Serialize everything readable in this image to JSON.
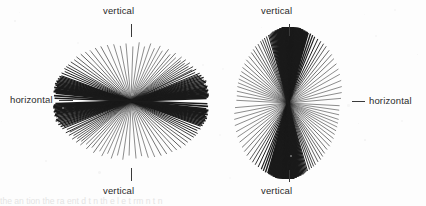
{
  "figure": {
    "background_color": "#fdfdfd",
    "ink_color": "#1a1a1a",
    "width": 426,
    "height": 206,
    "caption_partial": "the  an   tion    the ra ent  d  t  n  th   e   l   e  t rm n t  n"
  },
  "labels": {
    "vertical": "vertical",
    "horizontal": "horizontal"
  },
  "chart_data": {
    "type": "rose",
    "title": "",
    "subtitle": "",
    "xlabel": "",
    "ylabel": "",
    "grid": false,
    "legend_position": "none",
    "angle_units": "degrees",
    "angle_reference": "0 = horizontal, 90 = vertical",
    "panels": [
      {
        "id": "left",
        "name": "horizontal-preferred-orientation",
        "center": [
          131,
          101
        ],
        "radius": 78,
        "dominant_orientation": "horizontal",
        "labels": {
          "top": "vertical",
          "bottom": "vertical",
          "left": "horizontal"
        },
        "tick_marks": [
          "top-vertical",
          "bottom-vertical",
          "left-horizontal"
        ],
        "n_rays": 76,
        "angles_deg": [
          2,
          3,
          4,
          5,
          6,
          7,
          8,
          9,
          10,
          11,
          12,
          13,
          14,
          15,
          16,
          17,
          18,
          19,
          20,
          21,
          22,
          24,
          26,
          27,
          29,
          31,
          33,
          35,
          37,
          39,
          41,
          44,
          47,
          50,
          54,
          58,
          62,
          66,
          71,
          76,
          82,
          88,
          95,
          101,
          107,
          113,
          119,
          124,
          129,
          133,
          137,
          141,
          144,
          147,
          150,
          152,
          154,
          156,
          158,
          160,
          161,
          162,
          163,
          164,
          165,
          166,
          167,
          168,
          169,
          170,
          171,
          172,
          173,
          174,
          176,
          178
        ],
        "lengths_rel": [
          0.97,
          0.99,
          1.0,
          1.0,
          0.98,
          0.99,
          1.0,
          0.97,
          0.99,
          1.0,
          0.98,
          0.96,
          0.99,
          1.0,
          0.97,
          0.95,
          0.98,
          0.94,
          0.96,
          0.92,
          0.95,
          0.9,
          0.93,
          0.88,
          0.91,
          0.86,
          0.9,
          0.84,
          0.88,
          0.82,
          0.86,
          0.8,
          0.84,
          0.78,
          0.82,
          0.76,
          0.8,
          0.74,
          0.78,
          0.72,
          0.76,
          0.7,
          0.74,
          0.72,
          0.76,
          0.78,
          0.8,
          0.82,
          0.84,
          0.86,
          0.88,
          0.9,
          0.9,
          0.92,
          0.93,
          0.94,
          0.95,
          0.93,
          0.96,
          0.95,
          0.97,
          0.96,
          0.98,
          0.97,
          0.99,
          0.98,
          1.0,
          0.99,
          0.97,
          1.0,
          0.98,
          0.99,
          1.0,
          0.97,
          0.99,
          0.98
        ],
        "weights": [
          1.6,
          1.8,
          1.7,
          1.9,
          1.6,
          1.8,
          1.7,
          1.5,
          1.6,
          1.4,
          1.5,
          1.3,
          1.4,
          1.2,
          1.3,
          1.1,
          1.2,
          1.0,
          1.1,
          0.9,
          1.0,
          0.9,
          0.9,
          0.8,
          0.8,
          0.8,
          0.7,
          0.7,
          0.7,
          0.7,
          0.6,
          0.6,
          0.6,
          0.6,
          0.6,
          0.5,
          0.5,
          0.5,
          0.5,
          0.5,
          0.5,
          0.5,
          0.5,
          0.5,
          0.5,
          0.5,
          0.6,
          0.6,
          0.6,
          0.6,
          0.7,
          0.7,
          0.7,
          0.8,
          0.8,
          0.9,
          0.9,
          1.0,
          1.0,
          1.1,
          1.2,
          1.2,
          1.3,
          1.4,
          1.4,
          1.5,
          1.6,
          1.6,
          1.7,
          1.8,
          1.7,
          1.9,
          1.8,
          1.7,
          1.6,
          1.5
        ],
        "peak_angle_deg": 0,
        "concentration": "strong, girdle about the horizontal"
      },
      {
        "id": "right",
        "name": "vertical-preferred-orientation",
        "center": [
          288,
          103
        ],
        "radius": 76,
        "dominant_orientation": "vertical",
        "labels": {
          "top": "vertical",
          "bottom": "vertical",
          "right": "horizontal"
        },
        "tick_marks": [
          "top-vertical",
          "bottom-vertical",
          "right-horizontal"
        ],
        "n_rays": 78,
        "angles_deg": [
          5,
          11,
          17,
          23,
          29,
          34,
          39,
          44,
          48,
          52,
          56,
          59,
          62,
          65,
          68,
          70,
          72,
          74,
          75,
          76,
          77,
          78,
          79,
          80,
          81,
          82,
          83,
          84,
          85,
          86,
          86.5,
          87,
          87.5,
          88,
          88.5,
          89,
          89.5,
          90,
          90.5,
          91,
          91.5,
          92,
          92.5,
          93,
          93.5,
          94,
          95,
          96,
          97,
          98,
          99,
          100,
          101,
          102,
          103,
          104,
          105,
          106,
          108,
          110,
          112,
          114,
          117,
          120,
          123,
          126,
          130,
          134,
          138,
          142,
          146,
          150,
          154,
          158,
          162,
          167,
          172,
          177
        ],
        "lengths_rel": [
          0.7,
          0.72,
          0.74,
          0.76,
          0.78,
          0.8,
          0.82,
          0.84,
          0.86,
          0.88,
          0.9,
          0.91,
          0.92,
          0.93,
          0.94,
          0.95,
          0.96,
          0.96,
          0.97,
          0.97,
          0.98,
          0.98,
          0.99,
          0.99,
          1.0,
          1.0,
          1.0,
          1.0,
          1.0,
          1.0,
          1.0,
          1.0,
          1.0,
          1.0,
          1.0,
          1.0,
          1.0,
          1.0,
          1.0,
          1.0,
          1.0,
          1.0,
          1.0,
          1.0,
          1.0,
          1.0,
          0.99,
          0.99,
          0.98,
          0.98,
          0.97,
          0.97,
          0.96,
          0.96,
          0.95,
          0.94,
          0.93,
          0.93,
          0.92,
          0.91,
          0.9,
          0.89,
          0.87,
          0.86,
          0.84,
          0.82,
          0.8,
          0.79,
          0.77,
          0.76,
          0.74,
          0.73,
          0.72,
          0.71,
          0.7,
          0.69,
          0.68,
          0.68
        ],
        "weights": [
          0.5,
          0.5,
          0.5,
          0.5,
          0.5,
          0.5,
          0.55,
          0.6,
          0.6,
          0.65,
          0.7,
          0.8,
          0.9,
          1.0,
          1.1,
          1.3,
          1.5,
          1.7,
          1.9,
          2.0,
          2.1,
          2.2,
          2.3,
          2.4,
          2.5,
          2.6,
          2.7,
          2.8,
          2.9,
          3.0,
          3.0,
          3.1,
          3.1,
          3.2,
          3.2,
          3.2,
          3.2,
          3.2,
          3.2,
          3.2,
          3.1,
          3.1,
          3.0,
          3.0,
          2.9,
          2.8,
          2.6,
          2.4,
          2.2,
          2.0,
          1.8,
          1.6,
          1.5,
          1.4,
          1.3,
          1.2,
          1.1,
          1.0,
          0.9,
          0.85,
          0.8,
          0.75,
          0.7,
          0.7,
          0.65,
          0.65,
          0.6,
          0.6,
          0.6,
          0.55,
          0.55,
          0.55,
          0.5,
          0.5,
          0.5,
          0.5,
          0.5,
          0.5
        ],
        "peak_angle_deg": 90,
        "concentration": "very strong, clustered about the vertical"
      }
    ]
  }
}
